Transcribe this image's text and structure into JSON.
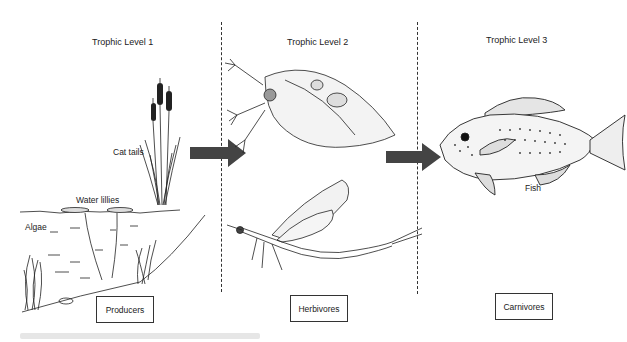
{
  "diagram": {
    "type": "food-chain-trophic-levels",
    "columns": [
      {
        "title": "Trophic Level 1",
        "category_box": "Producers",
        "organisms": [
          "Cat tails",
          "Water lillies",
          "Algae"
        ]
      },
      {
        "title": "Trophic Level 2",
        "category_box": "Herbivores",
        "organisms": []
      },
      {
        "title": "Trophic Level 3",
        "category_box": "Carnivores",
        "organisms": [
          "Fish"
        ]
      }
    ],
    "arrows": [
      {
        "from": "Trophic Level 1",
        "to": "Trophic Level 2"
      },
      {
        "from": "Trophic Level 2",
        "to": "Trophic Level 3"
      }
    ],
    "colors": {
      "arrow": "#444444",
      "line": "#333333",
      "background": "#ffffff"
    }
  }
}
